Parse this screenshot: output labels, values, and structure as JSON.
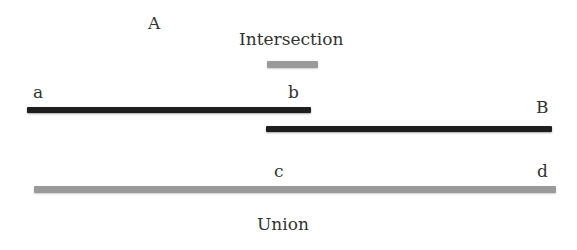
{
  "labels": {
    "set_a": "A",
    "set_b": "B",
    "intersection": "Intersection",
    "union": "Union",
    "a": "a",
    "b": "b",
    "c": "c",
    "d": "d"
  },
  "colors": {
    "interval_fill": "#1e1e1e",
    "result_fill": "#9a9a9a"
  },
  "intervals": [
    {
      "name": "A",
      "start_label": "a",
      "end_label": "b"
    },
    {
      "name": "B",
      "start_label": "c",
      "end_label": "d"
    }
  ]
}
